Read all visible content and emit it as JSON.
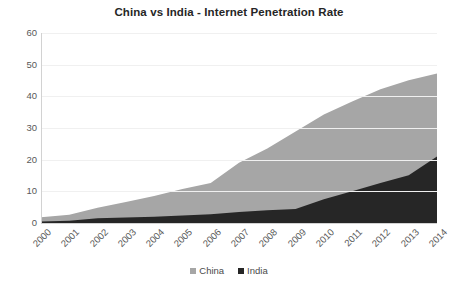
{
  "chart_data": {
    "type": "area",
    "stacked": true,
    "title": "China vs India - Internet Penetration Rate",
    "xlabel": "",
    "ylabel": "",
    "ylim": [
      0,
      60
    ],
    "yticks": [
      0,
      10,
      20,
      30,
      40,
      50,
      60
    ],
    "grid": true,
    "legend_position": "bottom",
    "categories": [
      "2000",
      "2001",
      "2002",
      "2003",
      "2004",
      "2005",
      "2006",
      "2007",
      "2008",
      "2009",
      "2010",
      "2011",
      "2012",
      "2013",
      "2014"
    ],
    "series": [
      {
        "name": "India",
        "color": "#262626",
        "values": [
          0.5,
          0.7,
          1.5,
          1.7,
          2.0,
          2.4,
          2.8,
          3.5,
          4.0,
          4.4,
          7.5,
          10.0,
          12.6,
          15.1,
          21.0
        ]
      },
      {
        "name": "China",
        "color": "#a6a6a6",
        "values": [
          1.3,
          1.9,
          3.3,
          4.9,
          6.5,
          8.3,
          9.8,
          15.5,
          19.5,
          24.5,
          26.8,
          28.4,
          29.6,
          30.0,
          26.2
        ]
      }
    ],
    "totals": [
      1.8,
      2.6,
      4.8,
      6.6,
      8.5,
      10.7,
      12.6,
      19.0,
      23.5,
      28.9,
      34.3,
      38.4,
      42.2,
      45.1,
      47.2
    ]
  },
  "legend": {
    "entries": [
      {
        "label": "China",
        "color": "#a6a6a6"
      },
      {
        "label": "India",
        "color": "#262626"
      }
    ]
  },
  "colors": {
    "china": "#a6a6a6",
    "india": "#262626",
    "gridline": "#f0f0f0",
    "axis": "#d2d2d2",
    "title_text": "#262626",
    "tick_text": "#595959",
    "background": "#ffffff"
  }
}
